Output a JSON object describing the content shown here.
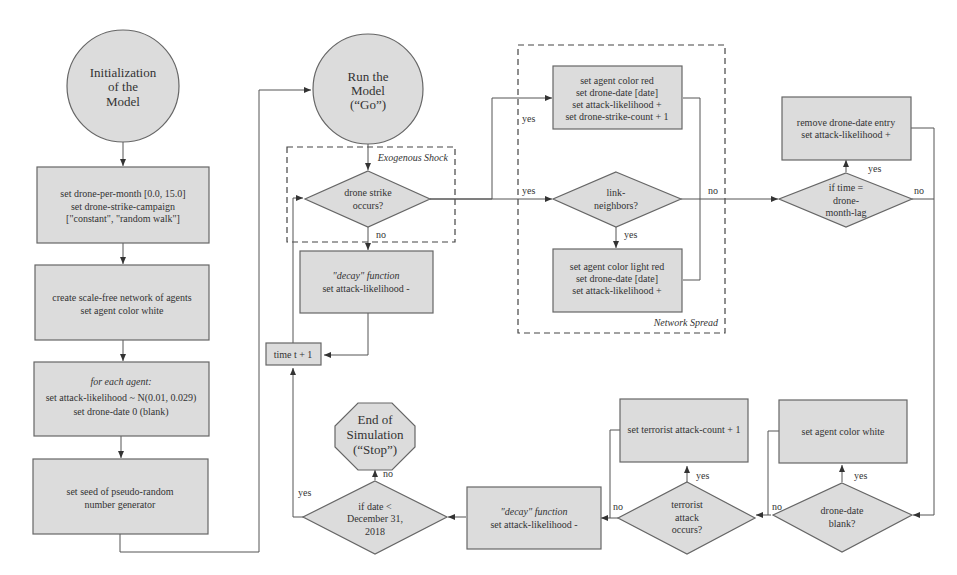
{
  "diagram": {
    "type": "flowchart",
    "style": {
      "node_fill": "#dcdcdc",
      "node_stroke": "#666666",
      "edge_color": "#555555",
      "text_color": "#333333"
    },
    "groups": {
      "exogenous_shock": {
        "label": "Exogenous Shock"
      },
      "network_spread": {
        "label": "Network Spread"
      }
    },
    "nodes": {
      "init": {
        "shape": "circle",
        "lines": [
          "Initialization",
          "of the",
          "Model"
        ]
      },
      "set_drone": {
        "shape": "rect",
        "lines": [
          "set drone-per-month [0.0, 15.0]",
          "set drone-strike-campaign",
          "[\"constant\", \"random walk\"]"
        ]
      },
      "create_network": {
        "shape": "rect",
        "lines": [
          "create scale-free network of agents",
          "set agent color white"
        ]
      },
      "each_agent": {
        "shape": "rect",
        "italic_line": "for each agent:",
        "lines": [
          "set attack-likelihood ~ N(0.01, 0.029)",
          "set drone-date 0 (blank)"
        ]
      },
      "seed": {
        "shape": "rect",
        "lines": [
          "set seed of pseudo-random",
          "number generator"
        ]
      },
      "run": {
        "shape": "circle",
        "lines": [
          "Run the",
          "Model",
          "(“Go”)"
        ]
      },
      "strike_occurs": {
        "shape": "diamond",
        "lines": [
          "drone strike",
          "occurs?"
        ]
      },
      "decay_top": {
        "shape": "rect",
        "italic_line": "\"decay\" function",
        "lines": [
          "set attack-likelihood -"
        ]
      },
      "time_inc": {
        "shape": "rect",
        "lines": [
          "time t + 1"
        ]
      },
      "red": {
        "shape": "rect",
        "lines": [
          "set agent color red",
          "set drone-date [date]",
          "set attack-likelihood +",
          "set drone-strike-count + 1"
        ]
      },
      "link_neighbors": {
        "shape": "diamond",
        "lines": [
          "link-",
          "neighbors?"
        ]
      },
      "light_red": {
        "shape": "rect",
        "lines": [
          "set agent color light red",
          "set drone-date [date]",
          "set attack-likelihood +"
        ]
      },
      "remove_entry": {
        "shape": "rect",
        "lines": [
          "remove drone-date entry",
          "set attack-likelihood +"
        ]
      },
      "time_lag": {
        "shape": "diamond",
        "lines": [
          "if time =",
          "drone-",
          "month-lag"
        ]
      },
      "end": {
        "shape": "octagon",
        "lines": [
          "End of",
          "Simulation",
          "(“Stop”)"
        ]
      },
      "date_check": {
        "shape": "diamond",
        "lines": [
          "if date <",
          "December 31,",
          "2018"
        ]
      },
      "decay_bottom": {
        "shape": "rect",
        "italic_line": "\"decay\" function",
        "lines": [
          "set attack-likelihood -"
        ]
      },
      "attack_count": {
        "shape": "rect",
        "lines": [
          "set terrorist attack-count + 1"
        ]
      },
      "attack_occurs": {
        "shape": "diamond",
        "lines": [
          "terrorist",
          "attack",
          "occurs?"
        ]
      },
      "set_white": {
        "shape": "rect",
        "lines": [
          "set agent color white"
        ]
      },
      "date_blank": {
        "shape": "diamond",
        "lines": [
          "drone-date",
          "blank?"
        ]
      }
    },
    "edge_labels": {
      "strike_yes_top": "yes",
      "strike_yes_mid": "yes",
      "strike_no": "no",
      "link_yes": "yes",
      "link_no": "no",
      "lag_yes": "yes",
      "lag_no": "no",
      "blank_yes": "yes",
      "blank_no": "no",
      "attack_yes": "yes",
      "attack_no": "no",
      "date_yes": "yes",
      "date_no": "no"
    }
  }
}
